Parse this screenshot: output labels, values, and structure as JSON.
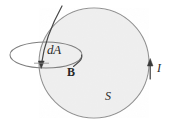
{
  "figure": {
    "background_color": "#ffffff",
    "surface": {
      "name": "sphere",
      "label": "S",
      "fill_color": "#f1f1f1",
      "stroke_color": "#8c8c8c",
      "center_x": 94,
      "center_y": 63,
      "radius": 55
    },
    "loop": {
      "name": "area-element-loop",
      "label": "dA",
      "stroke_color": "#7a7a7a",
      "center_x": 46,
      "center_y": 55,
      "radius_x": 36,
      "radius_y": 13
    },
    "field_vector": {
      "label": "B",
      "stroke_color": "#3a3a3a",
      "description": "curved field line entering the loop with arrowhead"
    },
    "current": {
      "label": "I",
      "stroke_color": "#3a3a3a",
      "arrow_x": 150,
      "arrow_y": 68,
      "direction": "up"
    },
    "labels": {
      "area_element": "dA",
      "magnetic_field": "B",
      "current": "I",
      "surface": "S"
    }
  }
}
